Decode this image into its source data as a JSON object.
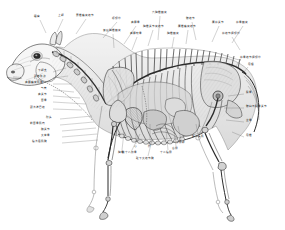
{
  "figure": {
    "name": "horse-anatomy-plate",
    "style": "grayscale pen-and-ink anatomical plate",
    "background_color": "#ffffff",
    "ink_color": "#2b2b2b",
    "label_color": "#1a1a1a"
  },
  "labels_top": [
    {
      "text": "眼窝",
      "x": 34,
      "y": 16,
      "lx": 40,
      "ly": 20,
      "tx": 46,
      "ty": 33
    },
    {
      "text": "上颌",
      "x": 58,
      "y": 15,
      "lx": 63,
      "ly": 19,
      "tx": 57,
      "ty": 32
    },
    {
      "text": "寰椎横突结节",
      "x": 76,
      "y": 15,
      "lx": 86,
      "ly": 19,
      "tx": 76,
      "ty": 34
    },
    {
      "text": "项韧带",
      "x": 112,
      "y": 18,
      "lx": 117,
      "ly": 22,
      "tx": 103,
      "ty": 38
    },
    {
      "text": "肩胛骨",
      "x": 131,
      "y": 22,
      "lx": 136,
      "ly": 26,
      "tx": 124,
      "ty": 44
    },
    {
      "text": "六胸椎棘突",
      "x": 152,
      "y": 12,
      "lx": 160,
      "ly": 16,
      "tx": 158,
      "ty": 40
    },
    {
      "text": "胸椎关节突结节",
      "x": 143,
      "y": 26,
      "lx": 153,
      "ly": 30,
      "tx": 148,
      "ty": 46
    },
    {
      "text": "腰椎横突结节",
      "x": 178,
      "y": 26,
      "lx": 188,
      "ly": 30,
      "tx": 186,
      "ty": 44
    },
    {
      "text": "腰荐关节",
      "x": 212,
      "y": 22,
      "lx": 219,
      "ly": 26,
      "tx": 212,
      "ty": 42
    },
    {
      "text": "荐骨棘突",
      "x": 236,
      "y": 22,
      "lx": 243,
      "ly": 26,
      "tx": 232,
      "ty": 43
    },
    {
      "text": "髋结节",
      "x": 186,
      "y": 18,
      "lx": 192,
      "ly": 22,
      "tx": 196,
      "ty": 40
    },
    {
      "text": "最后胸椎棘突",
      "x": 103,
      "y": 30,
      "lx": 113,
      "ly": 34,
      "tx": 114,
      "ty": 48
    },
    {
      "text": "肩胛软骨",
      "x": 130,
      "y": 33,
      "lx": 137,
      "ly": 37,
      "tx": 132,
      "ty": 50
    },
    {
      "text": "胸椎棘突",
      "x": 167,
      "y": 33,
      "lx": 174,
      "ly": 37,
      "tx": 172,
      "ty": 48
    },
    {
      "text": "荐结节阔韧带",
      "x": 222,
      "y": 33,
      "lx": 232,
      "ly": 37,
      "tx": 240,
      "ty": 50
    }
  ],
  "labels_left": [
    {
      "text": "下颌支",
      "x": 38,
      "y": 70,
      "lx": 53,
      "ly": 72,
      "tx": 66,
      "ty": 68
    },
    {
      "text": "颈静脉沟",
      "x": 34,
      "y": 76,
      "lx": 53,
      "ly": 78,
      "tx": 68,
      "ty": 76
    },
    {
      "text": "肩胛横突肌腱",
      "x": 25,
      "y": 82,
      "lx": 53,
      "ly": 84,
      "tx": 72,
      "ty": 84
    },
    {
      "text": "气管",
      "x": 41,
      "y": 88,
      "lx": 53,
      "ly": 90,
      "tx": 74,
      "ty": 92
    },
    {
      "text": "肩关节",
      "x": 38,
      "y": 94,
      "lx": 53,
      "ly": 96,
      "tx": 80,
      "ty": 98
    },
    {
      "text": "臂骨",
      "x": 41,
      "y": 100,
      "lx": 53,
      "ly": 102,
      "tx": 86,
      "ty": 104
    },
    {
      "text": "颈浅淋巴结",
      "x": 30,
      "y": 107,
      "lx": 53,
      "ly": 109,
      "tx": 82,
      "ty": 110
    },
    {
      "text": "肘头",
      "x": 46,
      "y": 117,
      "lx": 60,
      "ly": 119,
      "tx": 92,
      "ty": 116
    },
    {
      "text": "前臂骨肌肉",
      "x": 30,
      "y": 123,
      "lx": 60,
      "ly": 125,
      "tx": 94,
      "ty": 122
    },
    {
      "text": "腕关节",
      "x": 41,
      "y": 129,
      "lx": 62,
      "ly": 131,
      "tx": 96,
      "ty": 128
    },
    {
      "text": "大掌骨",
      "x": 41,
      "y": 135,
      "lx": 62,
      "ly": 137,
      "tx": 97,
      "ty": 134
    },
    {
      "text": "指浅屈肌腱",
      "x": 32,
      "y": 141,
      "lx": 62,
      "ly": 143,
      "tx": 98,
      "ty": 140
    }
  ],
  "labels_bottom": [
    {
      "text": "胸骨",
      "x": 118,
      "y": 152,
      "lx": 122,
      "ly": 150,
      "tx": 124,
      "ty": 132
    },
    {
      "text": "心",
      "x": 134,
      "y": 146,
      "lx": 136,
      "ly": 144,
      "tx": 136,
      "ty": 126
    },
    {
      "text": "肝",
      "x": 148,
      "y": 146,
      "lx": 150,
      "ly": 144,
      "tx": 150,
      "ty": 124
    },
    {
      "text": "第十八肋骨",
      "x": 122,
      "y": 152,
      "lx": 132,
      "ly": 150,
      "tx": 140,
      "ty": 134
    },
    {
      "text": "十二指肠",
      "x": 160,
      "y": 152,
      "lx": 168,
      "ly": 150,
      "tx": 166,
      "ty": 130
    },
    {
      "text": "小肠袢",
      "x": 176,
      "y": 142,
      "lx": 181,
      "ly": 140,
      "tx": 178,
      "ty": 126
    },
    {
      "text": "盲肠",
      "x": 172,
      "y": 148,
      "lx": 176,
      "ly": 146,
      "tx": 174,
      "ty": 132
    },
    {
      "text": "股二头肌",
      "x": 192,
      "y": 136,
      "lx": 198,
      "ly": 134,
      "tx": 196,
      "ty": 124
    },
    {
      "text": "耻下大结节腱",
      "x": 136,
      "y": 158,
      "lx": 148,
      "ly": 156,
      "tx": 152,
      "ty": 140
    }
  ],
  "labels_right": [
    {
      "text": "股骨",
      "x": 246,
      "y": 92,
      "lx": 244,
      "ly": 94,
      "tx": 228,
      "ty": 96
    },
    {
      "text": "髋臼与股骨关节",
      "x": 246,
      "y": 106,
      "lx": 244,
      "ly": 108,
      "tx": 224,
      "ty": 108
    },
    {
      "text": "坐骨",
      "x": 246,
      "y": 120,
      "lx": 244,
      "ly": 122,
      "tx": 226,
      "ty": 120
    },
    {
      "text": "尾椎",
      "x": 246,
      "y": 135,
      "lx": 244,
      "ly": 137,
      "tx": 232,
      "ty": 132
    },
    {
      "text": "荐骨结节阔韧带",
      "x": 240,
      "y": 57,
      "lx": 240,
      "ly": 60,
      "tx": 236,
      "ty": 66
    },
    {
      "text": "尾根",
      "x": 248,
      "y": 64,
      "lx": 248,
      "ly": 67,
      "tx": 244,
      "ty": 72
    }
  ],
  "anatomy_parts": [
    "头骨",
    "下颌骨",
    "颈椎",
    "胸椎",
    "腰椎",
    "荐骨",
    "尾椎",
    "肩胛骨",
    "臂骨",
    "前臂骨",
    "腕骨",
    "掌骨",
    "指骨",
    "肋骨",
    "胸骨",
    "骨盆",
    "股骨",
    "胫骨",
    "跗骨",
    "跖骨",
    "心",
    "肺",
    "肝",
    "胃",
    "小肠",
    "盲肠",
    "大结肠"
  ]
}
